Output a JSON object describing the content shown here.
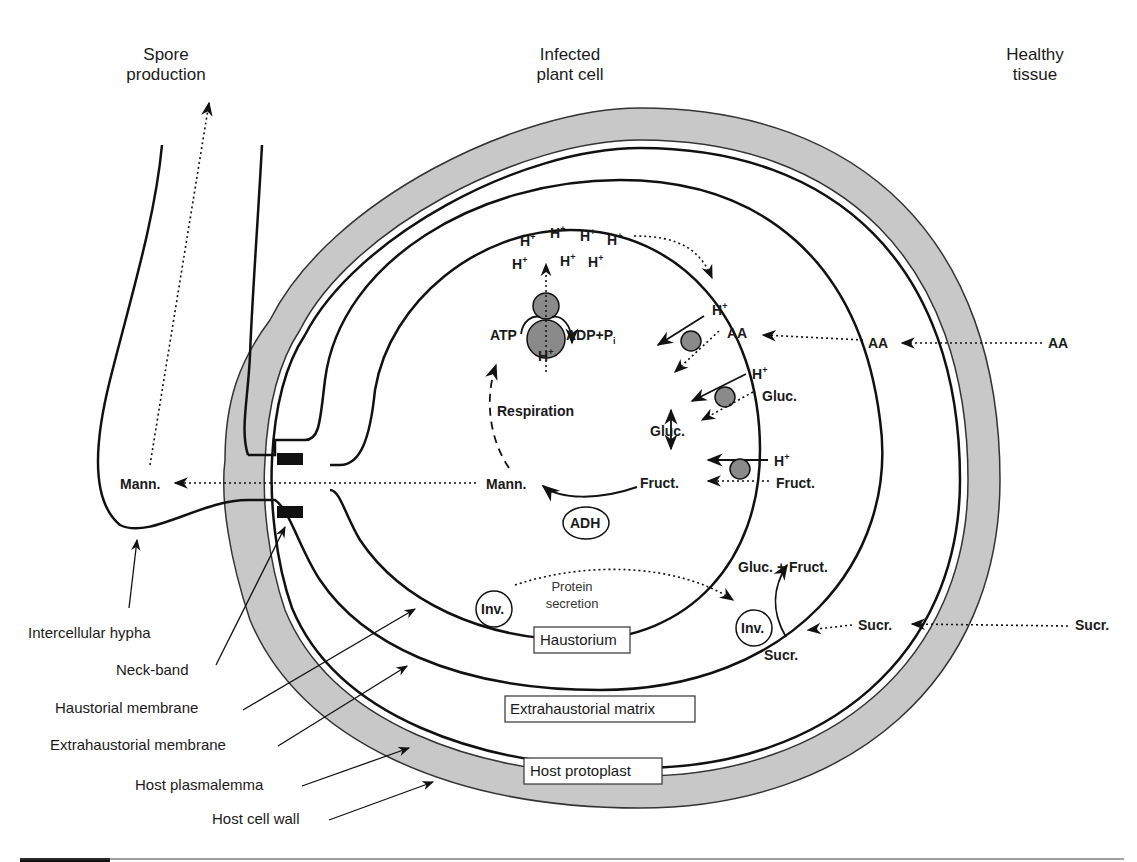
{
  "regions": {
    "spore_line1": "Spore",
    "spore_line2": "production",
    "infected_line1": "Infected",
    "infected_line2": "plant cell",
    "healthy_line1": "Healthy",
    "healthy_line2": "tissue"
  },
  "labels": {
    "intercellular_hypha": "Intercellular hypha",
    "neck_band": "Neck-band",
    "haustorial_membrane": "Haustorial membrane",
    "extrahaustorial_membrane": "Extrahaustorial membrane",
    "host_plasmalemma": "Host plasmalemma",
    "host_cell_wall": "Host cell wall"
  },
  "boxes": {
    "haustorium": "Haustorium",
    "extrahaustorial_matrix": "Extrahaustorial matrix",
    "host_protoplast": "Host protoplast"
  },
  "molecules": {
    "h": "H",
    "plus": "+",
    "atp": "ATP",
    "adp": "ADP+P",
    "adp_sub": "i",
    "respiration": "Respiration",
    "aa": "AA",
    "gluc": "Gluc.",
    "fruct": "Fruct.",
    "mann": "Mann.",
    "adh": "ADH",
    "inv": "Inv.",
    "protein_line1": "Protein",
    "protein_line2": "secretion",
    "gluc_fruct": "Gluc. + Fruct.",
    "sucr": "Sucr."
  },
  "colors": {
    "cell_wall_fill": "#c8c8c8",
    "transporter_fill": "#8a8a8a",
    "neck_band_fill": "#111111",
    "line": "#111111"
  }
}
